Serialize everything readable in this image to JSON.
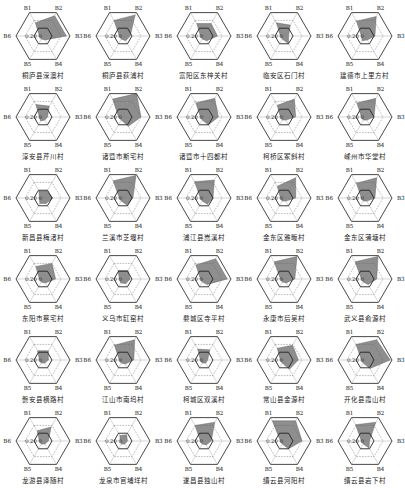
{
  "chart_data": {
    "type": "radar",
    "layout": {
      "rows": 6,
      "cols": 5
    },
    "axes": [
      "B1",
      "B2",
      "B3",
      "B4",
      "B5",
      "B6"
    ],
    "rlim": [
      0,
      0.3
    ],
    "ring_values": [
      0.1,
      0.2,
      0.3
    ],
    "tick_labels": [
      "0.20",
      "0"
    ],
    "fill_color": "#7a7a7a",
    "line_color": "#333333",
    "charts": [
      {
        "name": "桐庐县深澳村",
        "values": [
          0.17,
          0.26,
          0.26,
          0.05,
          0.04,
          0.04
        ]
      },
      {
        "name": "桐庐县荻浦村",
        "values": [
          0.2,
          0.27,
          0.08,
          0.06,
          0.04,
          0.04
        ]
      },
      {
        "name": "富阳区东梓关村",
        "values": [
          0.16,
          0.16,
          0.15,
          0.06,
          0.04,
          0.04
        ]
      },
      {
        "name": "临安区石门村",
        "values": [
          0.17,
          0.14,
          0.05,
          0.1,
          0.04,
          0.04
        ]
      },
      {
        "name": "建德市上里方村",
        "values": [
          0.19,
          0.25,
          0.11,
          0.05,
          0.06,
          0.04
        ]
      },
      {
        "name": "淳安县芹川村",
        "values": [
          0.16,
          0.14,
          0.05,
          0.04,
          0.05,
          0.04
        ]
      },
      {
        "name": "诸暨市斯宅村",
        "values": [
          0.23,
          0.3,
          0.2,
          0.12,
          0.04,
          0.05
        ]
      },
      {
        "name": "诸暨市十四都村",
        "values": [
          0.18,
          0.24,
          0.16,
          0.1,
          0.04,
          0.04
        ]
      },
      {
        "name": "柯桥区冢斜村",
        "values": [
          0.15,
          0.23,
          0.13,
          0.04,
          0.04,
          0.04
        ]
      },
      {
        "name": "嵊州市华堂村",
        "values": [
          0.18,
          0.24,
          0.1,
          0.04,
          0.04,
          0.04
        ]
      },
      {
        "name": "新昌县梅渚村",
        "values": [
          0.09,
          0.09,
          0.11,
          0.07,
          0.07,
          0.04
        ]
      },
      {
        "name": "兰溪市芝堰村",
        "values": [
          0.22,
          0.29,
          0.11,
          0.09,
          0.04,
          0.04
        ]
      },
      {
        "name": "浦江县嵩溪村",
        "values": [
          0.21,
          0.23,
          0.1,
          0.08,
          0.04,
          0.04
        ]
      },
      {
        "name": "金东区雅畈村",
        "values": [
          0.15,
          0.26,
          0.13,
          0.04,
          0.04,
          0.04
        ]
      },
      {
        "name": "金东区蒲塘村",
        "values": [
          0.19,
          0.26,
          0.11,
          0.04,
          0.04,
          0.04
        ]
      },
      {
        "name": "东阳市蔡宅村",
        "values": [
          0.16,
          0.2,
          0.14,
          0.05,
          0.04,
          0.04
        ]
      },
      {
        "name": "义乌市缸窑村",
        "values": [
          0.11,
          0.11,
          0.08,
          0.06,
          0.05,
          0.04
        ]
      },
      {
        "name": "婺城区寺平村",
        "values": [
          0.18,
          0.26,
          0.26,
          0.07,
          0.04,
          0.04
        ]
      },
      {
        "name": "永康市后吴村",
        "values": [
          0.22,
          0.29,
          0.12,
          0.05,
          0.04,
          0.04
        ]
      },
      {
        "name": "武义县俞源村",
        "values": [
          0.22,
          0.29,
          0.13,
          0.07,
          0.04,
          0.04
        ]
      },
      {
        "name": "磐安县横路村",
        "values": [
          0.12,
          0.12,
          0.06,
          0.04,
          0.04,
          0.04
        ]
      },
      {
        "name": "江山市南坞村",
        "values": [
          0.19,
          0.26,
          0.12,
          0.05,
          0.04,
          0.04
        ]
      },
      {
        "name": "柯城区双溪村",
        "values": [
          0.14,
          0.13,
          0.04,
          0.04,
          0.04,
          0.04
        ]
      },
      {
        "name": "常山县金源村",
        "values": [
          0.15,
          0.19,
          0.16,
          0.12,
          0.04,
          0.04
        ]
      },
      {
        "name": "开化县霞山村",
        "values": [
          0.2,
          0.26,
          0.28,
          0.11,
          0.04,
          0.04
        ]
      },
      {
        "name": "龙游县泽随村",
        "values": [
          0.13,
          0.18,
          0.06,
          0.04,
          0.04,
          0.04
        ]
      },
      {
        "name": "龙泉市官埔垟村",
        "values": [
          0.07,
          0.08,
          0.05,
          0.04,
          0.04,
          0.03
        ]
      },
      {
        "name": "遂昌县独山村",
        "values": [
          0.2,
          0.24,
          0.08,
          0.05,
          0.04,
          0.04
        ]
      },
      {
        "name": "缙云县河阳村",
        "values": [
          0.26,
          0.26,
          0.2,
          0.1,
          0.04,
          0.04
        ]
      },
      {
        "name": "缙云县岩下村",
        "values": [
          0.21,
          0.24,
          0.05,
          0.09,
          0.04,
          0.04
        ]
      }
    ]
  }
}
